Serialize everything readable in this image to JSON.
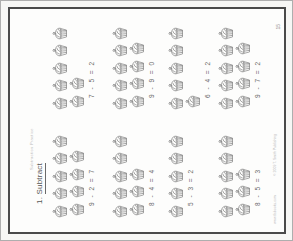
{
  "page": {
    "header_text": "Subtraction Practice",
    "title": {
      "number": "1.",
      "word": "Subtract"
    },
    "footer": {
      "website": "www.tlsbooks.com",
      "copyright": "© 2009 T. Smith Publishing",
      "page_number": "15"
    }
  },
  "icons": {
    "problem_icon": "cupcake-icon"
  },
  "colors": {
    "page_background": "#fdfdfc",
    "scan_frame": "#4a4a4a",
    "ink": "#686868",
    "faint_text": "#bababa"
  },
  "problems": [
    {
      "equation": "9 - 2 = 7",
      "minuend": 9,
      "subtrahend": 2,
      "difference": 7,
      "icons_row1": 5,
      "icons_row2": 4
    },
    {
      "equation": "7 - 5 = 2",
      "minuend": 7,
      "subtrahend": 5,
      "difference": 2,
      "icons_row1": 5,
      "icons_row2": 2
    },
    {
      "equation": "8 - 4 = 4",
      "minuend": 8,
      "subtrahend": 4,
      "difference": 4,
      "icons_row1": 5,
      "icons_row2": 3
    },
    {
      "equation": "9 - 9 = 0",
      "minuend": 9,
      "subtrahend": 9,
      "difference": 0,
      "icons_row1": 5,
      "icons_row2": 4
    },
    {
      "equation": "5 - 3 = 2",
      "minuend": 5,
      "subtrahend": 3,
      "difference": 2,
      "icons_row1": 5,
      "icons_row2": 0
    },
    {
      "equation": "6 - 4 = 2",
      "minuend": 6,
      "subtrahend": 4,
      "difference": 2,
      "icons_row1": 5,
      "icons_row2": 1
    },
    {
      "equation": "8 - 5 = 3",
      "minuend": 8,
      "subtrahend": 5,
      "difference": 3,
      "icons_row1": 5,
      "icons_row2": 3
    },
    {
      "equation": "9 - 7 = 2",
      "minuend": 9,
      "subtrahend": 7,
      "difference": 2,
      "icons_row1": 5,
      "icons_row2": 4
    }
  ]
}
